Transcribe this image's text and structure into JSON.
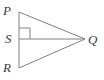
{
  "figure": {
    "kind": "geometry-diagram",
    "background_color": "#ffffff",
    "stroke_color": "#808080",
    "label_color": "#3b3b3b",
    "stroke_width": 1,
    "labels": {
      "p": "P",
      "s": "S",
      "r": "R",
      "q": "Q"
    },
    "points": {
      "P": {
        "x": 19,
        "y": 12
      },
      "S": {
        "x": 19,
        "y": 39
      },
      "R": {
        "x": 19,
        "y": 68
      },
      "Q": {
        "x": 85,
        "y": 39
      }
    },
    "segments": [
      {
        "name": "PR",
        "from": "P",
        "to": "R"
      },
      {
        "name": "PQ",
        "from": "P",
        "to": "Q"
      },
      {
        "name": "RQ",
        "from": "R",
        "to": "Q"
      },
      {
        "name": "SQ",
        "from": "S",
        "to": "Q"
      }
    ],
    "right_angle_marker": {
      "at": "S",
      "size": 11,
      "x": 19,
      "y": 28,
      "width": 11,
      "height": 11
    },
    "label_positions": {
      "P": {
        "x": 3,
        "y": 15
      },
      "S": {
        "x": 5,
        "y": 43
      },
      "R": {
        "x": 3,
        "y": 72
      },
      "Q": {
        "x": 88,
        "y": 44
      }
    }
  }
}
